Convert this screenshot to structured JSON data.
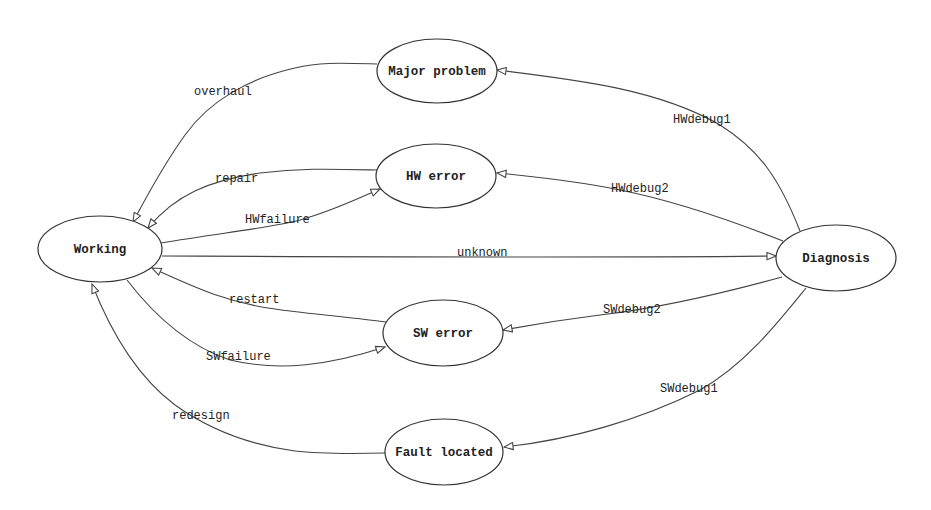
{
  "diagram": {
    "type": "state-transition",
    "nodes": {
      "working": {
        "label": "Working",
        "cx": 100,
        "cy": 249,
        "rx": 62,
        "ry": 33
      },
      "major_problem": {
        "label": "Major problem",
        "cx": 437,
        "cy": 71,
        "rx": 60,
        "ry": 32
      },
      "hw_error": {
        "label": "HW error",
        "cx": 436,
        "cy": 176,
        "rx": 60,
        "ry": 32
      },
      "sw_error": {
        "label": "SW error",
        "cx": 443,
        "cy": 333,
        "rx": 60,
        "ry": 33
      },
      "fault_located": {
        "label": "Fault located",
        "cx": 444,
        "cy": 452,
        "rx": 59,
        "ry": 33
      },
      "diagnosis": {
        "label": "Diagnosis",
        "cx": 836,
        "cy": 258,
        "rx": 60,
        "ry": 33
      }
    },
    "edges": {
      "overhaul": {
        "label": "overhaul",
        "from": "Major problem",
        "to": "Working"
      },
      "repair": {
        "label": "repair",
        "from": "HW error",
        "to": "Working"
      },
      "hwfailure": {
        "label": "HWfailure",
        "from": "Working",
        "to": "HW error"
      },
      "unknown": {
        "label": "unknown",
        "from": "Working",
        "to": "Diagnosis"
      },
      "restart": {
        "label": "restart",
        "from": "SW error",
        "to": "Working"
      },
      "swfailure": {
        "label": "SWfailure",
        "from": "Working",
        "to": "SW error"
      },
      "redesign": {
        "label": "redesign",
        "from": "Fault located",
        "to": "Working"
      },
      "hwdebug1": {
        "label": "HWdebug1",
        "from": "Diagnosis",
        "to": "Major problem"
      },
      "hwdebug2": {
        "label": "HWdebug2",
        "from": "Diagnosis",
        "to": "HW error"
      },
      "swdebug2": {
        "label": "SWdebug2",
        "from": "Diagnosis",
        "to": "SW error"
      },
      "swdebug1": {
        "label": "SWdebug1",
        "from": "Diagnosis",
        "to": "Fault located"
      }
    },
    "colors": {
      "stroke": "#333333",
      "background": "#ffffff",
      "text": "#222222"
    }
  }
}
